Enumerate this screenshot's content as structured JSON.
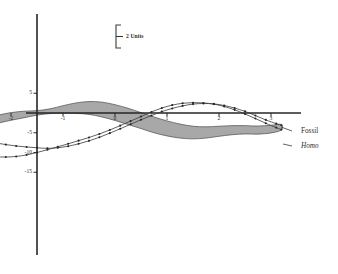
{
  "figure": {
    "background": "#ffffff",
    "ink_color": "#2b2b2b"
  },
  "scalebar": {
    "label": "2 Units",
    "units": 2
  },
  "legend": {
    "position": "right",
    "entries": [
      {
        "label": "Fossil",
        "style": "regular"
      },
      {
        "label": "Homo",
        "style": "italic"
      }
    ]
  },
  "chart_data": {
    "type": "line",
    "title": "",
    "subtitle": "",
    "xlabel": "",
    "ylabel": "",
    "xlim": [
      -3.6,
      3.35
    ],
    "ylim": [
      -17.5,
      7.5
    ],
    "grid": false,
    "legend_position": "right",
    "xticks": [
      -3,
      -2,
      -1,
      0,
      1,
      2,
      3
    ],
    "xtick_labels": [
      "-3",
      "-2",
      "-1",
      "0",
      "1",
      "2",
      "3"
    ],
    "yticks": [
      5,
      -5,
      -10,
      -15
    ],
    "ytick_labels": [
      "5",
      "-5",
      "-10",
      "-15"
    ],
    "annotations": [
      {
        "text": "2 Units",
        "type": "scale-bar",
        "value": 2
      }
    ],
    "series": [
      {
        "name": "Fossil",
        "kind": "band-upper",
        "style": "shaded-band",
        "fill": "#a8a8a8",
        "x": [
          -3.5,
          -3.25,
          -3.0,
          -2.75,
          -2.5,
          -2.25,
          -2.0,
          -1.75,
          -1.5,
          -1.25,
          -1.0,
          -0.75,
          -0.5,
          -0.25,
          0.0,
          0.25,
          0.5,
          0.75,
          1.0,
          1.25,
          1.5,
          1.75,
          2.0,
          2.25,
          2.5,
          2.75,
          3.0,
          3.2
        ],
        "values": [
          -2.6,
          -2.5,
          -2.3,
          -1.9,
          -1.3,
          -0.55,
          0.1,
          0.45,
          0.6,
          1.05,
          1.85,
          2.55,
          2.9,
          2.75,
          2.1,
          1.2,
          0.1,
          -1.0,
          -2.0,
          -2.8,
          -3.35,
          -3.5,
          -3.35,
          -3.2,
          -3.2,
          -3.3,
          -3.1,
          -2.9
        ]
      },
      {
        "name": "Fossil",
        "kind": "band-lower",
        "style": "shaded-band",
        "fill": "#a8a8a8",
        "x": [
          -3.5,
          -3.25,
          -3.0,
          -2.75,
          -2.5,
          -2.25,
          -2.0,
          -1.75,
          -1.5,
          -1.25,
          -1.0,
          -0.75,
          -0.5,
          -0.25,
          0.0,
          0.25,
          0.5,
          0.75,
          1.0,
          1.25,
          1.5,
          1.75,
          2.0,
          2.25,
          2.5,
          2.75,
          3.0,
          3.2
        ],
        "values": [
          -3.8,
          -3.85,
          -3.8,
          -3.55,
          -3.1,
          -2.55,
          -1.85,
          -1.2,
          -0.55,
          -0.15,
          -0.05,
          -0.1,
          -0.35,
          -1.0,
          -1.9,
          -2.9,
          -3.95,
          -5.0,
          -5.8,
          -6.35,
          -6.55,
          -6.35,
          -5.9,
          -5.5,
          -5.3,
          -5.35,
          -5.05,
          -4.3
        ]
      },
      {
        "name": "Homo",
        "kind": "dotted-line-1",
        "style": "dotted-markers",
        "x": [
          -3.5,
          -3.3,
          -3.1,
          -2.9,
          -2.7,
          -2.5,
          -2.3,
          -2.1,
          -1.9,
          -1.7,
          -1.5,
          -1.3,
          -1.1,
          -0.9,
          -0.7,
          -0.5,
          -0.3,
          -0.1,
          0.1,
          0.3,
          0.5,
          0.7,
          0.9,
          1.1,
          1.3,
          1.5,
          1.7,
          1.9,
          2.1,
          2.3,
          2.5,
          2.7,
          2.9,
          3.1,
          3.2
        ],
        "values": [
          -3.0,
          -3.9,
          -4.9,
          -5.7,
          -6.4,
          -7.0,
          -7.55,
          -8.0,
          -8.35,
          -8.6,
          -8.8,
          -8.95,
          -8.8,
          -8.4,
          -7.8,
          -7.05,
          -6.15,
          -5.1,
          -4.0,
          -2.85,
          -1.7,
          -0.65,
          0.35,
          1.15,
          1.8,
          2.25,
          2.4,
          2.3,
          1.9,
          1.25,
          0.4,
          -0.65,
          -1.75,
          -2.7,
          -3.1
        ]
      },
      {
        "name": "Homo",
        "kind": "dotted-line-2",
        "style": "dotted-markers",
        "x": [
          -3.5,
          -3.3,
          -3.1,
          -2.9,
          -2.7,
          -2.5,
          -2.3,
          -2.1,
          -1.9,
          -1.7,
          -1.5,
          -1.3,
          -1.1,
          -0.9,
          -0.7,
          -0.5,
          -0.3,
          -0.1,
          0.1,
          0.3,
          0.5,
          0.7,
          0.9,
          1.1,
          1.3,
          1.5,
          1.7,
          1.9,
          2.1,
          2.3,
          2.5,
          2.7,
          2.9,
          3.1,
          3.2
        ],
        "values": [
          -5.0,
          -6.6,
          -8.0,
          -9.2,
          -10.1,
          -10.7,
          -11.05,
          -11.15,
          -11.0,
          -10.6,
          -10.0,
          -9.3,
          -8.55,
          -7.8,
          -7.0,
          -6.2,
          -5.3,
          -4.3,
          -3.2,
          -2.05,
          -0.9,
          0.25,
          1.25,
          2.0,
          2.45,
          2.6,
          2.55,
          2.25,
          1.65,
          0.8,
          -0.25,
          -1.4,
          -2.6,
          -3.7,
          -4.2
        ]
      }
    ]
  }
}
